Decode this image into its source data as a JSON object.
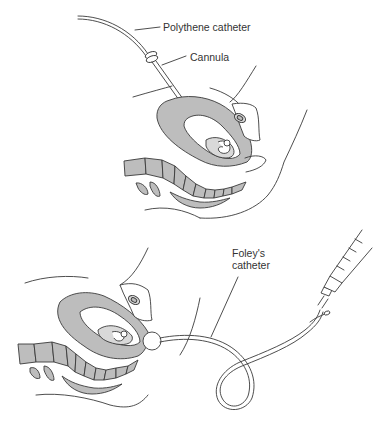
{
  "figure": {
    "panels": [
      {
        "id": "top",
        "description": "Amniotomy/intra-amniotic catheter insertion via cannula through abdominal wall into uterus",
        "labels": [
          {
            "text": "Polythene catheter"
          },
          {
            "text": "Cannula"
          }
        ]
      },
      {
        "id": "bottom",
        "description": "Foley's catheter inserted through cervix with inflated balloon, connected to syringe",
        "labels": [
          {
            "text": "Foley's\ncatheter",
            "line1": "Foley's",
            "line2": "catheter"
          }
        ]
      }
    ],
    "colors": {
      "line": "#3a3a3a",
      "shade": "#bdbdbd",
      "light_shade": "#d9d9d9",
      "background": "#ffffff"
    }
  }
}
